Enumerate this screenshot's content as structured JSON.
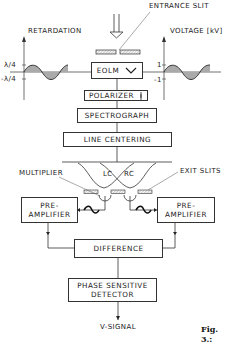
{
  "diagram": {
    "labels": {
      "entrance_slit": "ENTRANCE SLIT",
      "retardation": "RETARDATION",
      "voltage": "VOLTAGE [kV]",
      "ret_plus": "λ/4",
      "ret_minus": "-λ/4",
      "volt_plus": "1",
      "volt_minus": "-1",
      "multiplier": "MULTIPLIER",
      "exit_slits": "EXIT SLITS",
      "lc": "LC",
      "rc": "RC",
      "v_signal": "V-SIGNAL",
      "figure": "Fig. 3.:"
    },
    "blocks": {
      "eolm": "EOLM",
      "polarizer": "POLARIZER",
      "spectrograph": "SPECTROGRAPH",
      "line_centering": "LINE CENTERING",
      "preamp_left_1": "PRE-",
      "preamp_left_2": "AMPLIFIER",
      "preamp_right_1": "PRE-",
      "preamp_right_2": "AMPLIFIER",
      "difference": "DIFFERENCE",
      "psd_1": "PHASE SENSITIVE",
      "psd_2": "DETECTOR"
    },
    "colors": {
      "line": "#333333",
      "hatch": "#9a9a9a"
    }
  }
}
